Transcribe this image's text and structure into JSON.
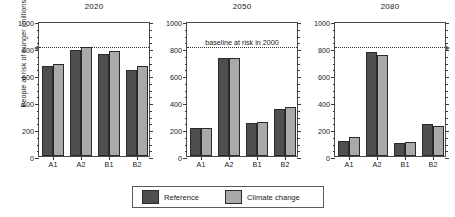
{
  "chart_data": {
    "type": "bar",
    "title": "",
    "ylabel": "People at risk of hunger (millions)",
    "xlabel": "",
    "ylim": [
      0,
      1000
    ],
    "yticks": [
      0,
      200,
      400,
      600,
      800,
      1000
    ],
    "minor_tick_step": 50,
    "grid": false,
    "legend_position": "bottom-center",
    "categories": [
      "A1",
      "A2",
      "B1",
      "B2"
    ],
    "legend": [
      "Reference",
      "Climate change"
    ],
    "colors": {
      "reference": "#4f4f4f",
      "climate_change": "#a9a9a9",
      "axis": "#3a3a3a",
      "baseline": "#333333"
    },
    "annotation": {
      "text": "baseline at risk in 2000",
      "value": 820
    },
    "panels": [
      {
        "title": "2020",
        "series": [
          {
            "name": "Reference",
            "values": [
              665,
              785,
              755,
              635
            ]
          },
          {
            "name": "Climate change",
            "values": [
              685,
              810,
              775,
              665
            ]
          }
        ]
      },
      {
        "title": "2050",
        "series": [
          {
            "name": "Reference",
            "values": [
              210,
              725,
              245,
              350
            ]
          },
          {
            "name": "Climate change",
            "values": [
              210,
              725,
              250,
              365
            ]
          }
        ]
      },
      {
        "title": "2080",
        "series": [
          {
            "name": "Reference",
            "values": [
              110,
              770,
              95,
              240
            ]
          },
          {
            "name": "Climate change",
            "values": [
              140,
              745,
              105,
              225
            ]
          }
        ]
      }
    ]
  }
}
